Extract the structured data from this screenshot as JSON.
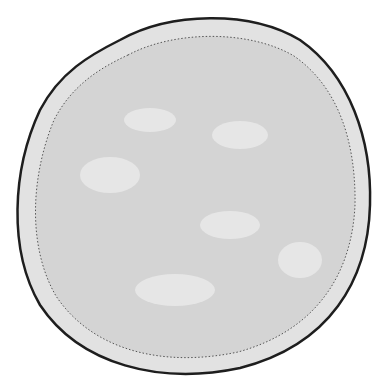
{
  "illustration": {
    "subject": "ciliated cell containing tangled coiled tube",
    "colors": {
      "background": "#ffffff",
      "cilia": "#2a2a2a",
      "membrane": "#1e1e1e",
      "cytoplasm": "#d6d6d6",
      "inner_rim": "#e2e2e2",
      "tube_fill": "#a9a9a9",
      "tube_dots": "#3a3a3a",
      "gap_light": "#e4e4e4"
    }
  }
}
